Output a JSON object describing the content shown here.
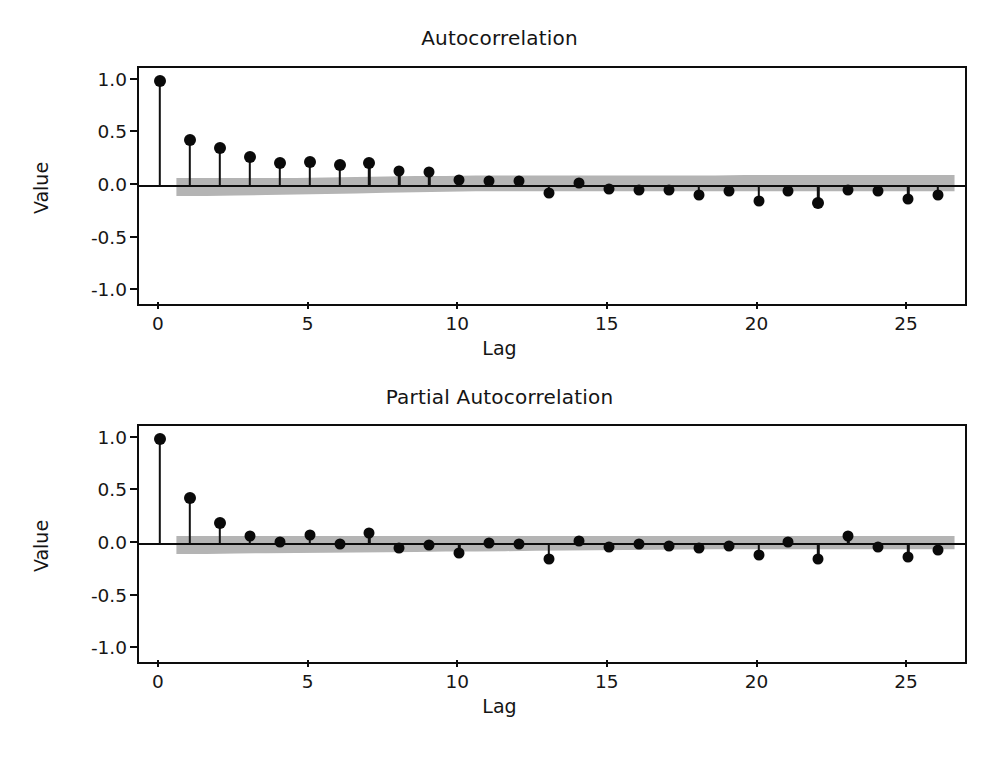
{
  "figure": {
    "caption": ""
  },
  "chart_data": [
    {
      "type": "bar",
      "subtype": "stem-acf",
      "title": "Autocorrelation",
      "xlabel": "Lag",
      "ylabel": "Value",
      "xlim": [
        -0.7,
        26.9
      ],
      "ylim": [
        -1.12,
        1.12
      ],
      "xticks": [
        0,
        5,
        10,
        15,
        20,
        25
      ],
      "xticklabels": [
        "0",
        "5",
        "10",
        "15",
        "20",
        "25"
      ],
      "yticks": [
        -1.0,
        -0.5,
        0.0,
        0.5,
        1.0
      ],
      "yticklabels": [
        "-1.0",
        "-0.5",
        "0.0",
        "0.5",
        "1.0"
      ],
      "grid": false,
      "legend": null,
      "zero_line": 0.0,
      "x": [
        0,
        1,
        2,
        3,
        4,
        5,
        6,
        7,
        8,
        9,
        10,
        11,
        12,
        13,
        14,
        15,
        16,
        17,
        18,
        19,
        20,
        21,
        22,
        23,
        24,
        25,
        26
      ],
      "values": [
        1.0,
        0.44,
        0.36,
        0.28,
        0.22,
        0.23,
        0.2,
        0.22,
        0.14,
        0.13,
        0.06,
        0.05,
        0.05,
        -0.07,
        0.03,
        -0.03,
        -0.04,
        -0.04,
        -0.09,
        -0.05,
        -0.14,
        -0.05,
        -0.16,
        -0.04,
        -0.05,
        -0.12,
        -0.09
      ],
      "confidence_band": {
        "color": "#b4b4b4",
        "upper": [
          0.075,
          0.075,
          0.075,
          0.075,
          0.075,
          0.08,
          0.085,
          0.09,
          0.095,
          0.095,
          0.1,
          0.1,
          0.1,
          0.1,
          0.1,
          0.1,
          0.1,
          0.1,
          0.1,
          0.105,
          0.105,
          0.105,
          0.105,
          0.105,
          0.105,
          0.105,
          0.105
        ],
        "lower": [
          -0.095,
          -0.095,
          -0.09,
          -0.085,
          -0.08,
          -0.075,
          -0.07,
          -0.065,
          -0.06,
          -0.055,
          -0.05,
          -0.05,
          -0.05,
          -0.05,
          -0.05,
          -0.05,
          -0.05,
          -0.05,
          -0.05,
          -0.05,
          -0.05,
          -0.05,
          -0.05,
          -0.05,
          -0.05,
          -0.05,
          -0.05
        ],
        "x_start": 0.55,
        "x_end": 26.55
      }
    },
    {
      "type": "bar",
      "subtype": "stem-pacf",
      "title": "Partial Autocorrelation",
      "xlabel": "Lag",
      "ylabel": "Value",
      "xlim": [
        -0.7,
        26.9
      ],
      "ylim": [
        -1.12,
        1.12
      ],
      "xticks": [
        0,
        5,
        10,
        15,
        20,
        25
      ],
      "xticklabels": [
        "0",
        "5",
        "10",
        "15",
        "20",
        "25"
      ],
      "yticks": [
        -1.0,
        -0.5,
        0.0,
        0.5,
        1.0
      ],
      "yticklabels": [
        "-1.0",
        "-0.5",
        "0.0",
        "0.5",
        "1.0"
      ],
      "grid": false,
      "legend": null,
      "zero_line": 0.0,
      "x": [
        0,
        1,
        2,
        3,
        4,
        5,
        6,
        7,
        8,
        9,
        10,
        11,
        12,
        13,
        14,
        15,
        16,
        17,
        18,
        19,
        20,
        21,
        22,
        23,
        24,
        25,
        26
      ],
      "values": [
        1.0,
        0.44,
        0.2,
        0.08,
        0.02,
        0.09,
        0.0,
        0.1,
        -0.04,
        -0.01,
        -0.09,
        0.01,
        0.0,
        -0.14,
        0.03,
        -0.03,
        0.0,
        -0.02,
        -0.04,
        -0.02,
        -0.1,
        0.02,
        -0.14,
        0.08,
        -0.03,
        -0.12,
        -0.06
      ],
      "confidence_band": {
        "color": "#b4b4b4",
        "upper": [
          0.075,
          0.075,
          0.075,
          0.075,
          0.075,
          0.075,
          0.075,
          0.075,
          0.075,
          0.075,
          0.075,
          0.075,
          0.075,
          0.075,
          0.075,
          0.075,
          0.075,
          0.075,
          0.075,
          0.075,
          0.075,
          0.075,
          0.075,
          0.075,
          0.075,
          0.075,
          0.075
        ],
        "lower": [
          -0.095,
          -0.095,
          -0.09,
          -0.088,
          -0.085,
          -0.082,
          -0.08,
          -0.078,
          -0.075,
          -0.072,
          -0.07,
          -0.068,
          -0.065,
          -0.062,
          -0.06,
          -0.058,
          -0.055,
          -0.052,
          -0.05,
          -0.05,
          -0.05,
          -0.05,
          -0.05,
          -0.05,
          -0.05,
          -0.05,
          -0.05
        ],
        "x_start": 0.55,
        "x_end": 26.55
      }
    }
  ]
}
